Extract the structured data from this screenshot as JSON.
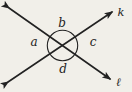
{
  "diagram": {
    "labels": {
      "angle_a": "a",
      "angle_b": "b",
      "angle_c": "c",
      "angle_d": "d",
      "ray_k": "k",
      "ray_l": "ℓ"
    },
    "colors": {
      "background": "#f1efe9",
      "line": "#222222"
    }
  }
}
